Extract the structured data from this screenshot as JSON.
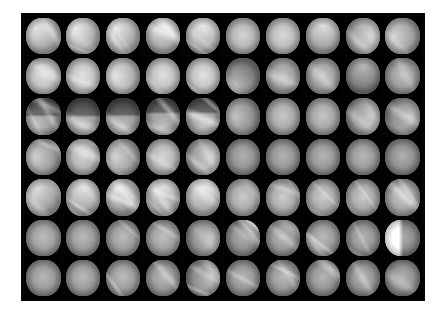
{
  "figure": {
    "name": "endoscopic-image-grid",
    "kind": "image-montage",
    "page_background": "#ffffff",
    "panel_background": "#050505",
    "canvas": {
      "width": 443,
      "height": 320
    },
    "panel": {
      "x": 21,
      "y": 13,
      "width": 404,
      "height": 288
    },
    "grid": {
      "columns": 10,
      "rows": 7,
      "gap": 1,
      "padding": 3
    },
    "tile_shape": "circle",
    "total_tiles": 70,
    "caption": ""
  },
  "palette": {
    "background": "#ffffff",
    "panel": "#050505",
    "tile_void": "#000000",
    "tissue_light": "#d8d2c8",
    "tissue_mid": "#9c958c",
    "tissue_dark": "#5d5850",
    "specular": "#ffffff"
  },
  "tiles": [
    {
      "r": 1,
      "c": 1,
      "base": 196,
      "tone": "#c9c3ba",
      "streaks": 1,
      "flare": "tl",
      "band": 0,
      "corner": ""
    },
    {
      "r": 1,
      "c": 2,
      "base": 200,
      "tone": "#cdc7be",
      "streaks": 2,
      "flare": "tl",
      "band": 0,
      "corner": ""
    },
    {
      "r": 1,
      "c": 3,
      "base": 198,
      "tone": "#cbc5bc",
      "streaks": 3,
      "flare": "tl",
      "band": 0,
      "corner": ""
    },
    {
      "r": 1,
      "c": 4,
      "base": 194,
      "tone": "#c7c1b8",
      "streaks": 3,
      "flare": "tc",
      "band": 0,
      "corner": ""
    },
    {
      "r": 1,
      "c": 5,
      "base": 197,
      "tone": "#cac4bb",
      "streaks": 2,
      "flare": "tc",
      "band": 0,
      "corner": ""
    },
    {
      "r": 1,
      "c": 6,
      "base": 178,
      "tone": "#b4aea6",
      "streaks": 0,
      "flare": "c",
      "band": 0,
      "corner": ""
    },
    {
      "r": 1,
      "c": 7,
      "base": 184,
      "tone": "#bab4ac",
      "streaks": 0,
      "flare": "c",
      "band": 0,
      "corner": ""
    },
    {
      "r": 1,
      "c": 8,
      "base": 186,
      "tone": "#bcb6ae",
      "streaks": 0,
      "flare": "tc",
      "band": 0,
      "corner": ""
    },
    {
      "r": 1,
      "c": 9,
      "base": 180,
      "tone": "#b6b0a8",
      "streaks": 1,
      "flare": "cr",
      "band": 0,
      "corner": ""
    },
    {
      "r": 1,
      "c": 10,
      "base": 176,
      "tone": "#b2aca4",
      "streaks": 1,
      "flare": "cl",
      "band": 0,
      "corner": ""
    },
    {
      "r": 2,
      "c": 1,
      "base": 190,
      "tone": "#c3bdb4",
      "streaks": 1,
      "flare": "c",
      "band": 0,
      "corner": ""
    },
    {
      "r": 2,
      "c": 2,
      "base": 192,
      "tone": "#c5bfb6",
      "streaks": 1,
      "flare": "c",
      "band": 0,
      "corner": ""
    },
    {
      "r": 2,
      "c": 3,
      "base": 193,
      "tone": "#c6c0b7",
      "streaks": 0,
      "flare": "cl",
      "band": 0,
      "corner": ""
    },
    {
      "r": 2,
      "c": 4,
      "base": 191,
      "tone": "#c4beb5",
      "streaks": 1,
      "flare": "c",
      "band": 0,
      "corner": ""
    },
    {
      "r": 2,
      "c": 5,
      "base": 192,
      "tone": "#c5bfb6",
      "streaks": 1,
      "flare": "c",
      "band": 0,
      "corner": ""
    },
    {
      "r": 2,
      "c": 6,
      "base": 150,
      "tone": "#8f8a82",
      "streaks": 1,
      "flare": "bl",
      "band": 0,
      "corner": ""
    },
    {
      "r": 2,
      "c": 7,
      "base": 158,
      "tone": "#979289",
      "streaks": 1,
      "flare": "c",
      "band": 0,
      "corner": ""
    },
    {
      "r": 2,
      "c": 8,
      "base": 160,
      "tone": "#999view",
      "streaks": 1,
      "flare": "c",
      "band": 0,
      "corner": ""
    },
    {
      "r": 2,
      "c": 9,
      "base": 148,
      "tone": "#8d8880",
      "streaks": 0,
      "flare": "tc",
      "band": 0,
      "corner": ""
    },
    {
      "r": 2,
      "c": 10,
      "base": 155,
      "tone": "#948f87",
      "streaks": 1,
      "flare": "c",
      "band": 0,
      "corner": ""
    },
    {
      "r": 3,
      "c": 1,
      "base": 150,
      "tone": "#8f8a82",
      "streaks": 3,
      "flare": "bl",
      "band": 1,
      "corner": ""
    },
    {
      "r": 3,
      "c": 2,
      "base": 146,
      "tone": "#8b867e",
      "streaks": 1,
      "flare": "bc",
      "band": 1,
      "corner": ""
    },
    {
      "r": 3,
      "c": 3,
      "base": 143,
      "tone": "#88837b",
      "streaks": 2,
      "flare": "bc",
      "band": 1,
      "corner": ""
    },
    {
      "r": 3,
      "c": 4,
      "base": 147,
      "tone": "#8c877f",
      "streaks": 3,
      "flare": "bc",
      "band": 1,
      "corner": ""
    },
    {
      "r": 3,
      "c": 5,
      "base": 152,
      "tone": "#918c84",
      "streaks": 3,
      "flare": "bc",
      "band": 1,
      "corner": ""
    },
    {
      "r": 3,
      "c": 6,
      "base": 160,
      "tone": "#999view",
      "streaks": 0,
      "flare": "cl",
      "band": 0,
      "corner": ""
    },
    {
      "r": 3,
      "c": 7,
      "base": 166,
      "tone": "#a09a92",
      "streaks": 0,
      "flare": "c",
      "band": 0,
      "corner": ""
    },
    {
      "r": 3,
      "c": 8,
      "base": 164,
      "tone": "#9e9890",
      "streaks": 0,
      "flare": "c",
      "band": 0,
      "corner": ""
    },
    {
      "r": 3,
      "c": 9,
      "base": 162,
      "tone": "#9c968e",
      "streaks": 2,
      "flare": "cr",
      "band": 0,
      "corner": ""
    },
    {
      "r": 3,
      "c": 10,
      "base": 158,
      "tone": "#979289",
      "streaks": 2,
      "flare": "cr",
      "band": 0,
      "corner": ""
    },
    {
      "r": 4,
      "c": 1,
      "base": 172,
      "tone": "#aea8a0",
      "streaks": 2,
      "flare": "cl",
      "band": 0,
      "corner": ""
    },
    {
      "r": 4,
      "c": 2,
      "base": 178,
      "tone": "#b4aea6",
      "streaks": 3,
      "flare": "c",
      "band": 0,
      "corner": ""
    },
    {
      "r": 4,
      "c": 3,
      "base": 176,
      "tone": "#b2aca4",
      "streaks": 2,
      "flare": "cl",
      "band": 0,
      "corner": ""
    },
    {
      "r": 4,
      "c": 4,
      "base": 180,
      "tone": "#b6b0a8",
      "streaks": 1,
      "flare": "c",
      "band": 0,
      "corner": ""
    },
    {
      "r": 4,
      "c": 5,
      "base": 174,
      "tone": "#b0aaa2",
      "streaks": 2,
      "flare": "cr",
      "band": 0,
      "corner": ""
    },
    {
      "r": 4,
      "c": 6,
      "base": 144,
      "tone": "#89847c",
      "streaks": 0,
      "flare": "c",
      "band": 0,
      "corner": ""
    },
    {
      "r": 4,
      "c": 7,
      "base": 146,
      "tone": "#8b867e",
      "streaks": 0,
      "flare": "c",
      "band": 0,
      "corner": ""
    },
    {
      "r": 4,
      "c": 8,
      "base": 148,
      "tone": "#8d8880",
      "streaks": 0,
      "flare": "c",
      "band": 0,
      "corner": ""
    },
    {
      "r": 4,
      "c": 9,
      "base": 150,
      "tone": "#8f8a82",
      "streaks": 0,
      "flare": "c",
      "band": 0,
      "corner": ""
    },
    {
      "r": 4,
      "c": 10,
      "base": 142,
      "tone": "#87827a",
      "streaks": 0,
      "flare": "c",
      "band": 0,
      "corner": ""
    },
    {
      "r": 5,
      "c": 1,
      "base": 188,
      "tone": "#c1bbb2",
      "streaks": 4,
      "flare": "tl",
      "band": 0,
      "corner": ""
    },
    {
      "r": 5,
      "c": 2,
      "base": 192,
      "tone": "#c5bfb6",
      "streaks": 4,
      "flare": "tc",
      "band": 0,
      "corner": ""
    },
    {
      "r": 5,
      "c": 3,
      "base": 186,
      "tone": "#bcb6ae",
      "streaks": 4,
      "flare": "tl",
      "band": 0,
      "corner": ""
    },
    {
      "r": 5,
      "c": 4,
      "base": 190,
      "tone": "#c3bdb4",
      "streaks": 4,
      "flare": "tc",
      "band": 0,
      "corner": ""
    },
    {
      "r": 5,
      "c": 5,
      "base": 196,
      "tone": "#c9c3ba",
      "streaks": 3,
      "flare": "tc",
      "band": 0,
      "corner": ""
    },
    {
      "r": 5,
      "c": 6,
      "base": 168,
      "tone": "#a29c94",
      "streaks": 1,
      "flare": "c",
      "band": 0,
      "corner": ""
    },
    {
      "r": 5,
      "c": 7,
      "base": 170,
      "tone": "#a49e96",
      "streaks": 2,
      "flare": "c",
      "band": 0,
      "corner": ""
    },
    {
      "r": 5,
      "c": 8,
      "base": 169,
      "tone": "#a39d95",
      "streaks": 2,
      "flare": "c",
      "band": 0,
      "corner": ""
    },
    {
      "r": 5,
      "c": 9,
      "base": 167,
      "tone": "#a19b93",
      "streaks": 2,
      "flare": "c",
      "band": 0,
      "corner": ""
    },
    {
      "r": 5,
      "c": 10,
      "base": 165,
      "tone": "#9f9991",
      "streaks": 2,
      "flare": "c",
      "band": 0,
      "corner": ""
    },
    {
      "r": 6,
      "c": 1,
      "base": 156,
      "tone": "#959087",
      "streaks": 0,
      "flare": "c",
      "band": 0,
      "corner": ""
    },
    {
      "r": 6,
      "c": 2,
      "base": 152,
      "tone": "#918c84",
      "streaks": 0,
      "flare": "c",
      "band": 0,
      "corner": ""
    },
    {
      "r": 6,
      "c": 3,
      "base": 154,
      "tone": "#938e86",
      "streaks": 1,
      "flare": "c",
      "band": 0,
      "corner": ""
    },
    {
      "r": 6,
      "c": 4,
      "base": 158,
      "tone": "#979289",
      "streaks": 1,
      "flare": "c",
      "band": 0,
      "corner": ""
    },
    {
      "r": 6,
      "c": 5,
      "base": 160,
      "tone": "#999view",
      "streaks": 1,
      "flare": "cr",
      "band": 0,
      "corner": ""
    },
    {
      "r": 6,
      "c": 6,
      "base": 140,
      "tone": "#858078",
      "streaks": 2,
      "flare": "c",
      "band": 0,
      "corner": "tr"
    },
    {
      "r": 6,
      "c": 7,
      "base": 150,
      "tone": "#8f8a82",
      "streaks": 2,
      "flare": "c",
      "band": 0,
      "corner": ""
    },
    {
      "r": 6,
      "c": 8,
      "base": 152,
      "tone": "#918c84",
      "streaks": 2,
      "flare": "c",
      "band": 0,
      "corner": ""
    },
    {
      "r": 6,
      "c": 9,
      "base": 146,
      "tone": "#8b867e",
      "streaks": 2,
      "flare": "c",
      "band": 0,
      "corner": ""
    },
    {
      "r": 6,
      "c": 10,
      "base": 138,
      "tone": "#838076",
      "streaks": 1,
      "flare": "c",
      "band": 0,
      "corner": "lhalf"
    },
    {
      "r": 7,
      "c": 1,
      "base": 150,
      "tone": "#8f8a82",
      "streaks": 0,
      "flare": "c",
      "band": 0,
      "corner": ""
    },
    {
      "r": 7,
      "c": 2,
      "base": 152,
      "tone": "#918c84",
      "streaks": 0,
      "flare": "c",
      "band": 0,
      "corner": ""
    },
    {
      "r": 7,
      "c": 3,
      "base": 154,
      "tone": "#938e86",
      "streaks": 1,
      "flare": "c",
      "band": 0,
      "corner": ""
    },
    {
      "r": 7,
      "c": 4,
      "base": 151,
      "tone": "#908b83",
      "streaks": 1,
      "flare": "c",
      "band": 0,
      "corner": ""
    },
    {
      "r": 7,
      "c": 5,
      "base": 156,
      "tone": "#959087",
      "streaks": 3,
      "flare": "cr",
      "band": 0,
      "corner": ""
    },
    {
      "r": 7,
      "c": 6,
      "base": 148,
      "tone": "#8d8880",
      "streaks": 1,
      "flare": "c",
      "band": 0,
      "corner": ""
    },
    {
      "r": 7,
      "c": 7,
      "base": 150,
      "tone": "#8f8a82",
      "streaks": 3,
      "flare": "c",
      "band": 0,
      "corner": ""
    },
    {
      "r": 7,
      "c": 8,
      "base": 147,
      "tone": "#8c877f",
      "streaks": 2,
      "flare": "c",
      "band": 0,
      "corner": ""
    },
    {
      "r": 7,
      "c": 9,
      "base": 145,
      "tone": "#8a857d",
      "streaks": 1,
      "flare": "c",
      "band": 0,
      "corner": ""
    },
    {
      "r": 7,
      "c": 10,
      "base": 143,
      "tone": "#88837b",
      "streaks": 1,
      "flare": "c",
      "band": 0,
      "corner": ""
    }
  ]
}
